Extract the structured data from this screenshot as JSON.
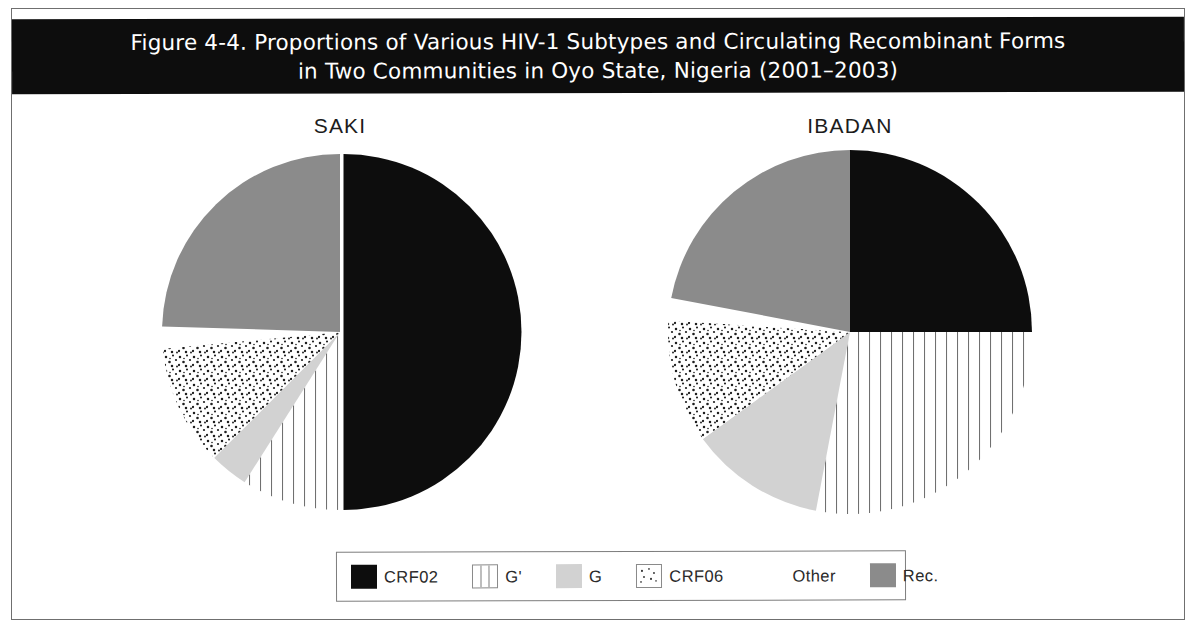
{
  "figure": {
    "title_line_1": "Figure 4-4.  Proportions of Various HIV-1 Subtypes and Circulating Recombinant Forms",
    "title_line_2": "in Two Communities in Oyo State, Nigeria (2001–2003)"
  },
  "legend": {
    "items": [
      {
        "label": "CRF02",
        "swatch": "solid-black",
        "color": "#0d0d0d"
      },
      {
        "label": "G'",
        "swatch": "vertical-stripes",
        "color": "#ffffff"
      },
      {
        "label": "G",
        "swatch": "solid-light-gray",
        "color": "#d2d2d2"
      },
      {
        "label": "CRF06",
        "swatch": "stippled-dots",
        "color": "#ffffff"
      },
      {
        "label": "Other",
        "swatch": "solid-white",
        "color": "#ffffff"
      },
      {
        "label": "Rec.",
        "swatch": "solid-gray",
        "color": "#8b8b8b"
      }
    ]
  },
  "chart_data": {
    "type": "pie",
    "title": "Figure 4-4.  Proportions of Various HIV-1 Subtypes and Circulating Recombinant Forms in Two Communities in Oyo State, Nigeria (2001–2003)",
    "categories": [
      "CRF02",
      "G'",
      "G",
      "CRF06",
      "Other",
      "Rec."
    ],
    "units": "percent",
    "start_angle_deg": 0,
    "direction": "clockwise",
    "legend_position": "bottom",
    "charts": [
      {
        "name": "SAKI",
        "title": "SAKI",
        "values": [
          50.0,
          9.0,
          3.5,
          11.0,
          2.0,
          24.5
        ],
        "slices": [
          {
            "label": "CRF02",
            "value": 50.0,
            "fill": "solid-black"
          },
          {
            "label": "G'",
            "value": 9.0,
            "fill": "vertical-stripes"
          },
          {
            "label": "G",
            "value": 3.5,
            "fill": "solid-light-gray"
          },
          {
            "label": "CRF06",
            "value": 11.0,
            "fill": "stippled-dots"
          },
          {
            "label": "Other",
            "value": 2.0,
            "fill": "solid-white"
          },
          {
            "label": "Rec.",
            "value": 24.5,
            "fill": "solid-gray"
          }
        ]
      },
      {
        "name": "IBADAN",
        "title": "IBADAN",
        "values": [
          25.0,
          28.0,
          12.0,
          11.0,
          2.0,
          22.0
        ],
        "slices": [
          {
            "label": "CRF02",
            "value": 25.0,
            "fill": "solid-black"
          },
          {
            "label": "G'",
            "value": 28.0,
            "fill": "vertical-stripes"
          },
          {
            "label": "G",
            "value": 12.0,
            "fill": "solid-light-gray"
          },
          {
            "label": "CRF06",
            "value": 11.0,
            "fill": "stippled-dots"
          },
          {
            "label": "Other",
            "value": 2.0,
            "fill": "solid-white"
          },
          {
            "label": "Rec.",
            "value": 22.0,
            "fill": "solid-gray"
          }
        ]
      }
    ]
  },
  "colors": {
    "banner_background": "#0d0d0d",
    "banner_text": "#ffffff",
    "frame": "#6f6f6f",
    "crf02": "#0d0d0d",
    "g": "#d2d2d2",
    "rec": "#8b8b8b",
    "other": "#ffffff",
    "stroke": "#6a6a6a"
  }
}
